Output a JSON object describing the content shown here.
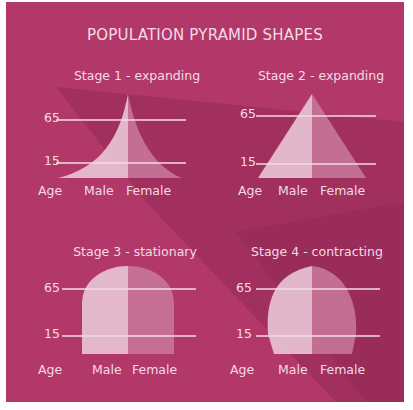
{
  "title": "POPULATION PYRAMID SHAPES",
  "colors": {
    "background": "#b3386a",
    "dark_band": "#8f2853",
    "male_fill": "#e9c6d6",
    "female_fill": "#c77699",
    "line": "#f3dbe6",
    "text": "#f3dbe6"
  },
  "axis": {
    "age_label": "Age",
    "male_label": "Male",
    "female_label": "Female",
    "tick_65": "65",
    "tick_15": "15"
  },
  "panels": [
    {
      "title": "Stage 1 - expanding",
      "shape": "concave-pyramid"
    },
    {
      "title": "Stage 2 - expanding",
      "shape": "triangle"
    },
    {
      "title": "Stage 3 - stationary",
      "shape": "bell"
    },
    {
      "title": "Stage 4 - contracting",
      "shape": "narrow-base-bell"
    }
  ]
}
